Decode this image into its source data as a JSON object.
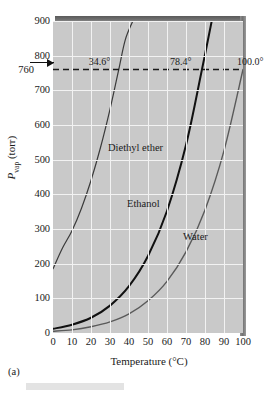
{
  "figure": {
    "panel_caption": "(a)",
    "background_color": "#ffffff",
    "plot_background_color": "#c9c9c9",
    "grid_color": "#f2f2f2",
    "frame_color": "#6e6e6e"
  },
  "chart_data": {
    "type": "line",
    "title": "",
    "xlabel": "Temperature (°C)",
    "ylabel": "P_vap (torr)",
    "ylabel_parts": {
      "base": "P",
      "sub": "vap",
      "unit": "(torr)"
    },
    "xlim": [
      0,
      100
    ],
    "ylim": [
      0,
      900
    ],
    "xticks": [
      0,
      10,
      20,
      30,
      40,
      50,
      60,
      70,
      80,
      90,
      100
    ],
    "xtick_labels": [
      "0",
      "10",
      "20",
      "30",
      "40",
      "50",
      "60",
      "70",
      "80",
      "90",
      "100"
    ],
    "yticks": [
      0,
      100,
      200,
      300,
      400,
      500,
      600,
      700,
      800,
      900
    ],
    "ytick_labels": [
      "0",
      "100",
      "200",
      "300",
      "400",
      "500",
      "600",
      "700",
      "800",
      "900"
    ],
    "grid": true,
    "legend": "inline-labels",
    "reference_line": {
      "value": 760,
      "label": "760",
      "style": "dashed",
      "orientation": "horizontal",
      "color": "#1a1a1a"
    },
    "annotations": [
      {
        "text": "34.6°",
        "x": 34.6,
        "y": 760,
        "series": "Diethyl ether"
      },
      {
        "text": "78.4°",
        "x": 78.4,
        "y": 760,
        "series": "Ethanol"
      },
      {
        "text": "100.0°",
        "x": 100.0,
        "y": 760,
        "series": "Water"
      }
    ],
    "series": [
      {
        "name": "Diethyl ether",
        "label": "Diethyl ether",
        "color": "#3a3a3a",
        "width": 1.2,
        "x": [
          0,
          5,
          10,
          15,
          20,
          25,
          30,
          34.6,
          38,
          42,
          45
        ],
        "values": [
          185,
          245,
          295,
          360,
          440,
          535,
          645,
          760,
          845,
          900,
          940
        ]
      },
      {
        "name": "Ethanol",
        "label": "Ethanol",
        "color": "#111111",
        "width": 2.0,
        "x": [
          0,
          10,
          20,
          30,
          40,
          50,
          60,
          70,
          78.4,
          85
        ],
        "values": [
          12,
          24,
          44,
          79,
          135,
          222,
          352,
          542,
          760,
          940
        ]
      },
      {
        "name": "Water",
        "label": "Water",
        "color": "#5a5a5a",
        "width": 1.4,
        "x": [
          0,
          10,
          20,
          30,
          40,
          50,
          60,
          70,
          80,
          90,
          100
        ],
        "values": [
          5,
          9,
          18,
          32,
          55,
          93,
          149,
          234,
          355,
          526,
          760
        ]
      }
    ]
  }
}
